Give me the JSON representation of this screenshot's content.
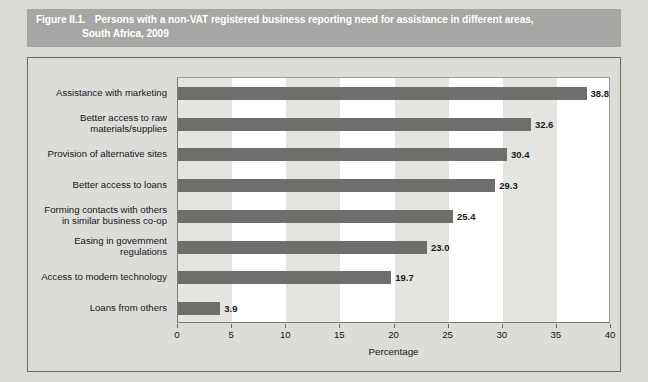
{
  "figure": {
    "number": "Figure II.1.",
    "title_line1": "Persons with a non-VAT registered business reporting need for assistance in different areas,",
    "title_line2": "South Africa, 2009",
    "banner_color": "#a6a6a4",
    "bar_color": "#6e6e6c",
    "plot_background": "#ffffff",
    "band_color": "#e4e4e1"
  },
  "chart_data": {
    "type": "bar",
    "orientation": "horizontal",
    "title": "Persons with a non-VAT registered business reporting need for assistance in different areas, South Africa, 2009",
    "xlabel": "Percentage",
    "ylabel": "",
    "xlim": [
      0,
      40
    ],
    "grid": false,
    "legend": false,
    "categories": [
      "Assistance with marketing",
      "Better access to raw\nmaterials/supplies",
      "Provision of alternative sites",
      "Better access to loans",
      "Forming contacts with others\nin similar business co-op",
      "Easing in government\nregulations",
      "Access to modern technology",
      "Loans from others"
    ],
    "values": [
      38.8,
      32.6,
      30.4,
      29.3,
      25.4,
      23.0,
      19.7,
      3.9
    ],
    "value_labels": [
      "38.8",
      "32.6",
      "30.4",
      "29.3",
      "25.4",
      "23.0",
      "19.7",
      "3.9"
    ],
    "xticks": [
      0,
      5,
      10,
      15,
      20,
      25,
      30,
      35,
      40
    ],
    "xtick_labels": [
      "0",
      "5",
      "10",
      "15",
      "20",
      "25",
      "30",
      "35",
      "40"
    ]
  }
}
